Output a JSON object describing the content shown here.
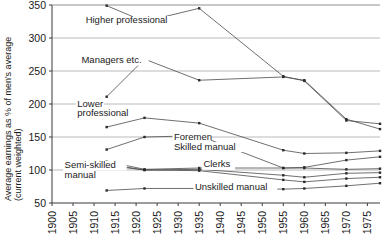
{
  "chart_data": {
    "type": "line",
    "title": "",
    "subtitle": "",
    "xlabel": "",
    "ylabel": "Average earnings as % of men's average (current weighted)",
    "ylabel_line1": "Average earnings as % of men's average",
    "ylabel_line2": "(current weighted)",
    "xlim": [
      1900,
      1978
    ],
    "ylim": [
      50,
      350
    ],
    "y_ticks": [
      50,
      100,
      150,
      200,
      250,
      300,
      350
    ],
    "x_ticks": [
      1900,
      1905,
      1910,
      1915,
      1920,
      1925,
      1930,
      1935,
      1940,
      1945,
      1950,
      1955,
      1960,
      1965,
      1970,
      1975
    ],
    "grid": true,
    "legend_position": "inline-annotations",
    "series": [
      {
        "name": "Higher professional",
        "label_x": 1908,
        "label_y": 322,
        "label_lines": [
          "Higher professional"
        ],
        "x": [
          1913,
          1922,
          1935,
          1955,
          1960,
          1970,
          1978
        ],
        "values": [
          349,
          325,
          345,
          242,
          235,
          175,
          170
        ]
      },
      {
        "name": "Managers etc.",
        "label_x": 1907,
        "label_y": 262,
        "label_lines": [
          "Managers etc."
        ],
        "x": [
          1913,
          1922,
          1935,
          1955,
          1960,
          1970,
          1978
        ],
        "values": [
          211,
          268,
          236,
          241,
          236,
          177,
          162
        ]
      },
      {
        "name": "Lower professional",
        "label_x": 1906,
        "label_y": 196,
        "label_lines": [
          "Lower",
          "professional"
        ],
        "x": [
          1913,
          1922,
          1935,
          1955,
          1960,
          1970,
          1978
        ],
        "values": [
          165,
          179,
          171,
          130,
          125,
          126,
          129
        ]
      },
      {
        "name": "Foremen",
        "label_x": 1929,
        "label_y": 145,
        "label_lines": [
          "Foremen"
        ],
        "x": [
          1913,
          1922,
          1935,
          1955,
          1960,
          1970,
          1978
        ],
        "values": [
          131,
          150,
          152,
          103,
          104,
          115,
          120
        ]
      },
      {
        "name": "Skilled manual",
        "label_x": 1929,
        "label_y": 131,
        "label_lines": [
          "Skilled manual"
        ],
        "x": [
          1913,
          1922,
          1935,
          1955,
          1960,
          1970,
          1978
        ],
        "values": [
          113,
          101,
          103,
          103,
          103,
          101,
          102
        ]
      },
      {
        "name": "Clerks",
        "label_x": 1936,
        "label_y": 104,
        "label_lines": [
          "Clerks"
        ],
        "x": [
          1913,
          1922,
          1935,
          1955,
          1960,
          1970,
          1978
        ],
        "values": [
          109,
          100,
          101,
          92,
          89,
          95,
          96
        ]
      },
      {
        "name": "Semi-skilled manual",
        "label_x": 1903,
        "label_y": 103,
        "label_lines": [
          "Semi-skilled",
          "manual"
        ],
        "x": [
          1913,
          1922,
          1935,
          1955,
          1960,
          1970,
          1978
        ],
        "values": [
          107,
          100,
          99,
          85,
          82,
          87,
          89
        ]
      },
      {
        "name": "Unskilled manual",
        "label_x": 1934,
        "label_y": 70,
        "label_lines": [
          "Unskilled manual"
        ],
        "x": [
          1913,
          1922,
          1935,
          1955,
          1960,
          1970,
          1978
        ],
        "values": [
          69,
          72,
          72,
          71,
          72,
          76,
          80
        ]
      }
    ]
  },
  "colors": {
    "line": "#4a4a4a",
    "marker": "#2b2b2b",
    "grid": "#a8a8a8",
    "axis": "#3a3a3a",
    "text": "#1a1a1a",
    "background": "#ffffff"
  }
}
